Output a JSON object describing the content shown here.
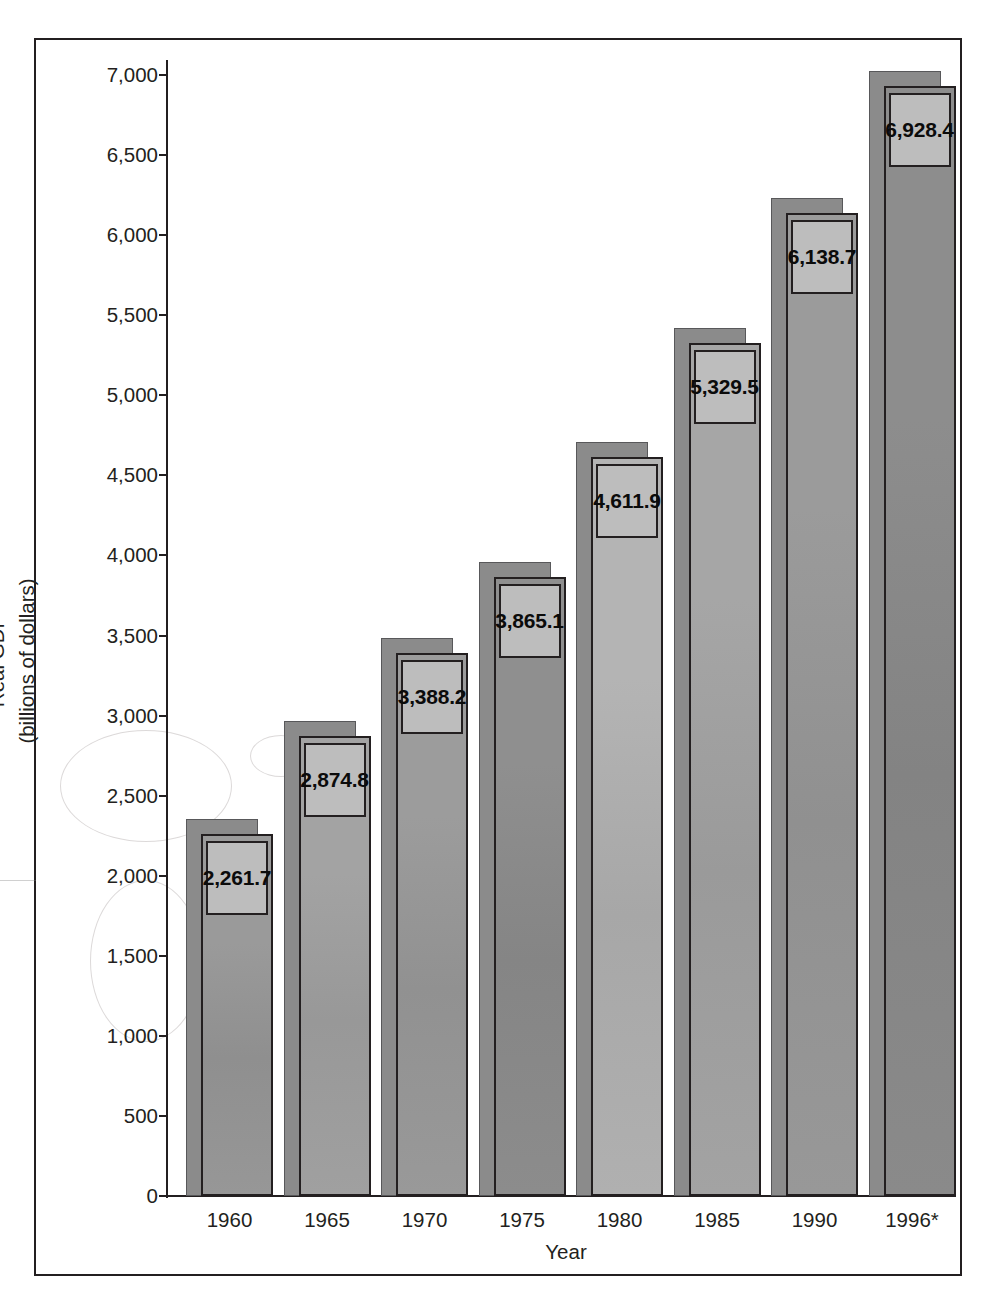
{
  "chart_data": {
    "type": "bar",
    "title": "",
    "xlabel": "Year",
    "ylabel": "Real GDP (billions of dollars)",
    "ylabel_line1": "Real GDP",
    "ylabel_line2": "(billions of dollars)",
    "categories": [
      "1960",
      "1965",
      "1970",
      "1975",
      "1980",
      "1985",
      "1990",
      "1996*"
    ],
    "values": [
      2261.7,
      2874.8,
      3388.2,
      3865.1,
      4611.9,
      5329.5,
      6138.7,
      6928.4
    ],
    "value_labels": [
      "2,261.7",
      "2,874.8",
      "3,388.2",
      "3,865.1",
      "4,611.9",
      "5,329.5",
      "6,138.7",
      "6,928.4"
    ],
    "ylim": [
      0,
      7000
    ],
    "ytick_values": [
      0,
      500,
      1000,
      1500,
      2000,
      2500,
      3000,
      3500,
      4000,
      4500,
      5000,
      5500,
      6000,
      6500,
      7000
    ],
    "ytick_labels": [
      "0",
      "500",
      "1,000",
      "1,500",
      "2,000",
      "2,500",
      "3,000",
      "3,500",
      "4,000",
      "4,500",
      "5,000",
      "5,500",
      "6,000",
      "6,500",
      "7,000"
    ],
    "grid": false,
    "legend": null,
    "style": "3d-column",
    "footnote_marker": "*",
    "bar_fill_colors": [
      "#9a9a9a",
      "#a3a3a3",
      "#9c9c9c",
      "#8f8f8f",
      "#b4b4b4",
      "#a6a6a6",
      "#9b9b9b",
      "#8d8d8d"
    ],
    "bar_shadow_color": "#8b8b8b",
    "bar_outline_color": "#231f20",
    "label_box_fill": "#bdbdbd",
    "axis_color": "#231f20",
    "background_color": "#ffffff"
  }
}
